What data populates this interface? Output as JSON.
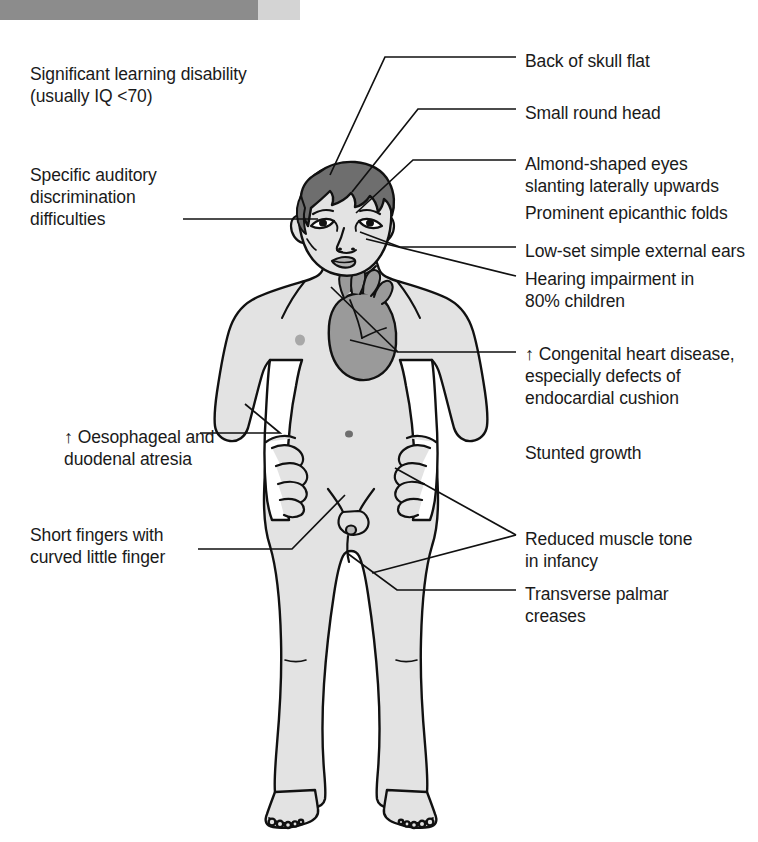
{
  "page": {
    "background_color": "#ffffff",
    "text_color": "#1a1a1a"
  },
  "banner": {
    "name": "chapter-banner",
    "bar_color": "#8c8c8c",
    "cap_color": "#d4d4d4"
  },
  "figure": {
    "name": "child-body-diagram",
    "skin_fill": "#e3e3e3",
    "hair_fill": "#6e6e6e",
    "heart_fill": "#9a9a9a",
    "outline_color": "#111111",
    "organ_outline_color": "#111111"
  },
  "labels": {
    "left": [
      {
        "id": "learning-disability",
        "text": "Significant learning disability\n(usually IQ <70)",
        "x": 30,
        "y": 63,
        "has_arrow": false,
        "has_leader": false
      },
      {
        "id": "auditory-discrimination",
        "text": "Specific auditory\ndiscrimination\ndifficulties",
        "x": 30,
        "y": 164,
        "has_arrow": false,
        "has_leader": true
      },
      {
        "id": "oesophageal-duodenal-atresia",
        "arrow": "↑",
        "text": " Oesophageal and\nduodenal atresia",
        "x": 64,
        "y": 426,
        "has_arrow": true,
        "has_leader": true
      },
      {
        "id": "short-fingers",
        "text": "Short fingers with\ncurved little finger",
        "x": 30,
        "y": 524,
        "has_arrow": false,
        "has_leader": true
      }
    ],
    "right": [
      {
        "id": "back-of-skull-flat",
        "text": "Back of skull flat",
        "x": 525,
        "y": 50,
        "has_arrow": false,
        "has_leader": true
      },
      {
        "id": "small-round-head",
        "text": "Small round head",
        "x": 525,
        "y": 102,
        "has_arrow": false,
        "has_leader": true
      },
      {
        "id": "almond-shaped-eyes",
        "text": "Almond-shaped eyes\nslanting laterally upwards",
        "x": 525,
        "y": 153,
        "has_arrow": false,
        "has_leader": true
      },
      {
        "id": "prominent-epicanthic-folds",
        "text": "Prominent epicanthic folds",
        "x": 525,
        "y": 202,
        "has_arrow": false,
        "has_leader": false
      },
      {
        "id": "low-set-simple-external-ears",
        "text": "Low-set simple external ears",
        "x": 525,
        "y": 240,
        "has_arrow": false,
        "has_leader": true
      },
      {
        "id": "hearing-impairment",
        "text": "Hearing impairment in\n80% children",
        "x": 525,
        "y": 268,
        "has_arrow": false,
        "has_leader": true
      },
      {
        "id": "congenital-heart-disease",
        "arrow": "↑",
        "text": " Congenital heart disease,\nespecially defects of\nendocardial cushion",
        "x": 525,
        "y": 343,
        "has_arrow": true,
        "has_leader": true
      },
      {
        "id": "stunted-growth",
        "text": "Stunted growth",
        "x": 525,
        "y": 442,
        "has_arrow": false,
        "has_leader": false
      },
      {
        "id": "reduced-muscle-tone",
        "text": "Reduced muscle tone\nin infancy",
        "x": 525,
        "y": 528,
        "has_arrow": false,
        "has_leader": true
      },
      {
        "id": "transverse-palmar-creases",
        "text": "Transverse palmar\ncreases",
        "x": 525,
        "y": 583,
        "has_arrow": false,
        "has_leader": true
      }
    ]
  },
  "leader_lines": [
    {
      "id": "leader-auditory",
      "points": "183,219 318,219"
    },
    {
      "id": "leader-back-of-skull",
      "points": "516,57 385,57 330,175"
    },
    {
      "id": "leader-small-round-head",
      "points": "516,109 418,109 352,192"
    },
    {
      "id": "leader-almond-eyes",
      "points": "516,160 413,160 356,213"
    },
    {
      "id": "leader-low-set-ears",
      "points": "516,247 400,247 360,232"
    },
    {
      "id": "leader-hearing",
      "points": "516,276 366,239"
    },
    {
      "id": "leader-heart",
      "points": "516,352 398,352 350,340"
    },
    {
      "id": "leader-heart-2",
      "points": "398,352 331,287"
    },
    {
      "id": "leader-oesophageal",
      "points": "200,433 280,433 245,404"
    },
    {
      "id": "leader-short-fingers",
      "points": "198,549 292,549 345,495"
    },
    {
      "id": "leader-muscle-tone-upper",
      "points": "516,535 395,468"
    },
    {
      "id": "leader-muscle-tone-lower",
      "points": "516,535 372,573"
    },
    {
      "id": "leader-transverse-creases",
      "points": "516,590 397,590 347,553"
    }
  ]
}
